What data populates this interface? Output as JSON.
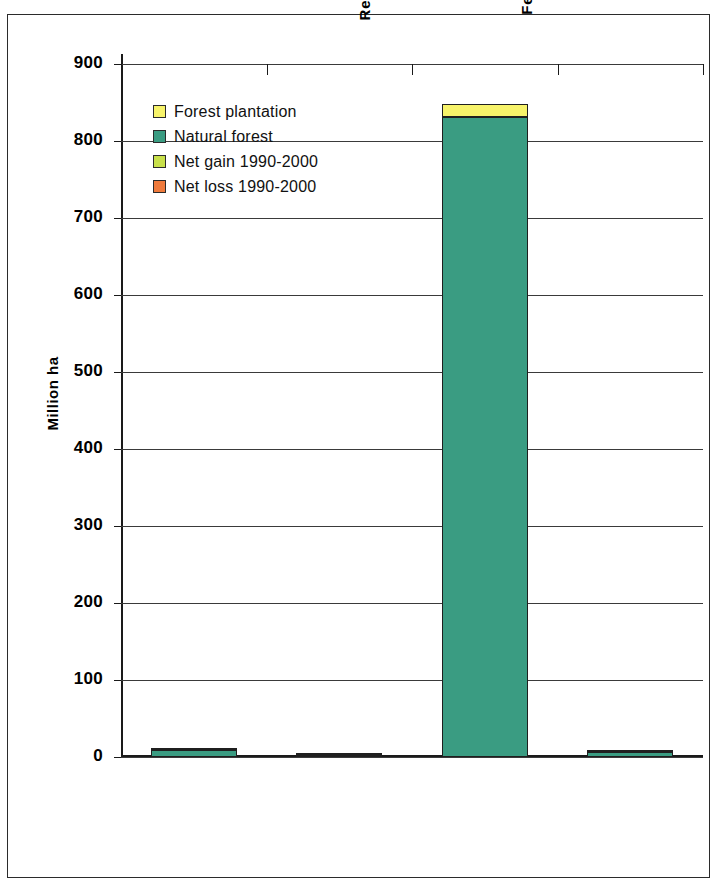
{
  "chart_data": {
    "type": "bar",
    "subtype": "stacked-bar",
    "title": "",
    "xlabel": "",
    "ylabel": "Million ha",
    "ylim": [
      0,
      900
    ],
    "yticks": [
      0,
      100,
      200,
      300,
      400,
      500,
      600,
      700,
      800,
      900
    ],
    "ytick_labels": [
      "0",
      "100",
      "200",
      "300",
      "400",
      "500",
      "600",
      "700",
      "800",
      "900"
    ],
    "grid": true,
    "legend_position": "upper-left-inside",
    "categories": [
      "Belarus",
      "Republic of\nMoldova",
      "Russian\nFederation",
      "Ukraine"
    ],
    "category_labels": [
      "Belarus",
      "Republic of Moldova",
      "Russian Federation",
      "Ukraine"
    ],
    "series": [
      {
        "name": "Natural forest",
        "color": "#3a9c82",
        "values": [
          8.9,
          0.3,
          831.0,
          6.7
        ]
      },
      {
        "name": "Forest plantation",
        "color": "#f7f36a",
        "values": [
          0.4,
          0.03,
          17.3,
          2.9
        ]
      },
      {
        "name": "Net gain 1990-2000",
        "color": "#c8e04a",
        "values": [
          0,
          0,
          0,
          0
        ]
      },
      {
        "name": "Net loss 1990-2000",
        "color": "#ef7a3c",
        "values": [
          0,
          0,
          0,
          0
        ]
      }
    ],
    "totals": [
      9.3,
      0.33,
      848.3,
      9.6
    ],
    "units": "Million ha"
  },
  "legend": {
    "items": [
      {
        "label": "Forest plantation",
        "color": "#f7f36a"
      },
      {
        "label": "Natural forest",
        "color": "#3a9c82"
      },
      {
        "label": "Net gain 1990-2000",
        "color": "#c8e04a"
      },
      {
        "label": "Net loss 1990-2000",
        "color": "#ef7a3c"
      }
    ]
  },
  "axes": {
    "y_title": "Million ha",
    "y_tick_labels": [
      "900",
      "800",
      "700",
      "600",
      "500",
      "400",
      "300",
      "200",
      "100",
      "0"
    ],
    "x_tick_labels": [
      "Belarus",
      "Republic of\nMoldova",
      "Russian\nFederation",
      "Ukraine"
    ]
  },
  "colors": {
    "forest_plantation": "#f7f36a",
    "natural_forest": "#3a9c82",
    "net_gain": "#c8e04a",
    "net_loss": "#ef7a3c",
    "axis": "#1a1a1a",
    "grid": "#3a3a3a",
    "frame": "#2b2b2b"
  }
}
